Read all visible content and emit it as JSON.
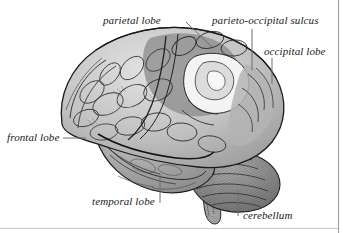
{
  "figure": {
    "style": "engraving",
    "background_color": "#ffffff",
    "ink_color": "#1a1a1a",
    "leader_color": "#6e6e6e",
    "frame_color": "#9a9a9a"
  },
  "labels": {
    "parietal_lobe": "parietal lobe",
    "parieto_occipital_sulcus": "parieto-occipital sulcus",
    "occipital_lobe": "occipital lobe",
    "frontal_lobe": "frontal lobe",
    "temporal_lobe": "temporal lobe",
    "cerebellum": "cerebellum"
  },
  "regions": [
    {
      "name": "frontal lobe",
      "shade": "#c9c9c9"
    },
    {
      "name": "parietal lobe",
      "shade": "#8f8f8f"
    },
    {
      "name": "parieto-occipital sulcus",
      "shade": "#f2f2f2"
    },
    {
      "name": "occipital lobe",
      "shade": "#b0b0b0"
    },
    {
      "name": "temporal lobe",
      "shade": "#9e9e9e"
    },
    {
      "name": "cerebellum",
      "shade": "#8a8a8a"
    },
    {
      "name": "brainstem",
      "shade": "#a5a5a5"
    }
  ]
}
